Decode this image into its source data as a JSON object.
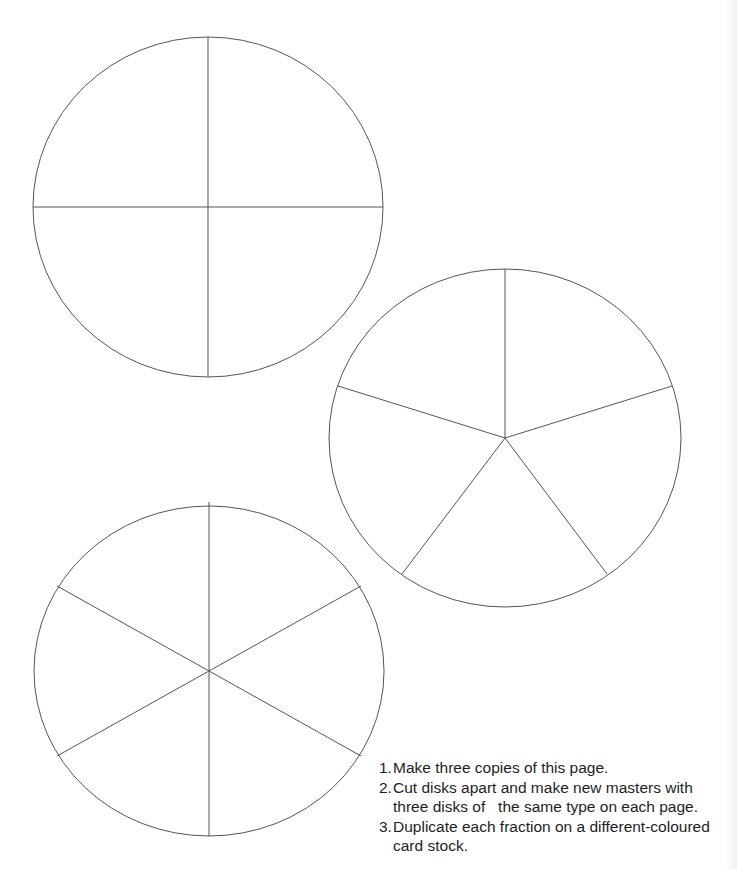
{
  "page": {
    "background": "#ffffff",
    "line_color": "#555555"
  },
  "disks": [
    {
      "name": "quarters-disk",
      "divisions": 4,
      "cx": 208,
      "cy": 207,
      "rx": 175,
      "ry": 170,
      "spokes": [
        [
          208,
          37
        ],
        [
          383,
          207
        ],
        [
          208,
          377
        ],
        [
          33,
          207
        ]
      ]
    },
    {
      "name": "fifths-disk",
      "divisions": 5,
      "cx": 505,
      "cy": 438,
      "rx": 176,
      "ry": 169,
      "spokes": [
        [
          505,
          269
        ],
        [
          672,
          386
        ],
        [
          607,
          574
        ],
        [
          402,
          574
        ],
        [
          338,
          386
        ]
      ]
    },
    {
      "name": "sixths-disk",
      "divisions": 6,
      "cx": 209,
      "cy": 671,
      "rx": 175,
      "ry": 165,
      "spokes": [
        [
          209,
          502
        ],
        [
          361,
          586
        ],
        [
          361,
          756
        ],
        [
          209,
          836
        ],
        [
          57,
          756
        ],
        [
          57,
          586
        ]
      ]
    }
  ],
  "instructions": [
    {
      "num": "1.",
      "text": "Make three copies of this page."
    },
    {
      "num": "2.",
      "text": "Cut disks apart and make new masters with three disks of   the same type on each page."
    },
    {
      "num": "3.",
      "text": "Duplicate each fraction on a different-coloured card stock."
    }
  ]
}
